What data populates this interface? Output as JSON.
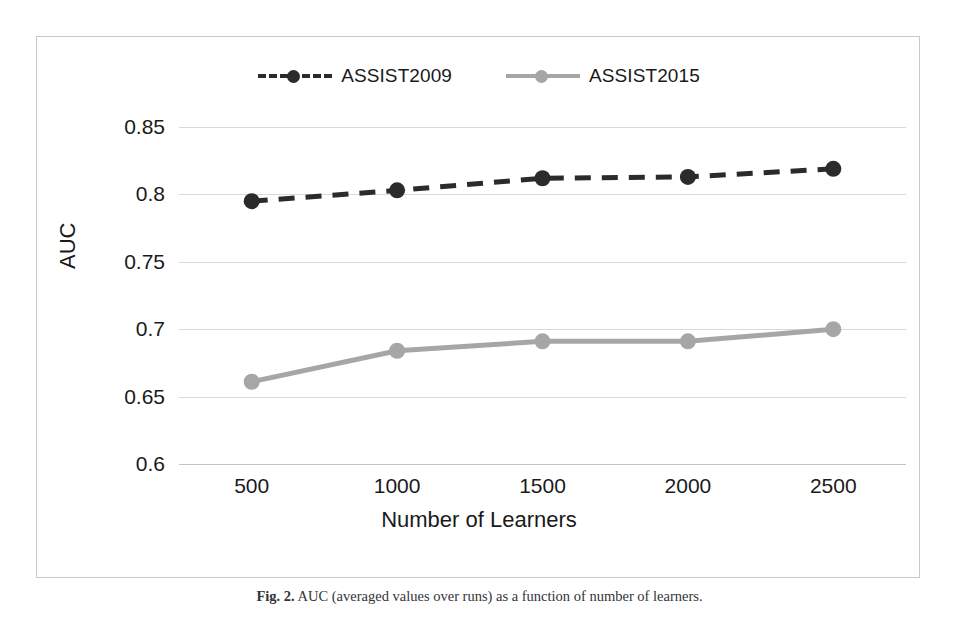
{
  "figure": {
    "caption_label": "Fig. 2.",
    "caption_text": "AUC (averaged values over runs) as a function of number of learners."
  },
  "chart_data": {
    "type": "line",
    "title": "",
    "xlabel": "Number of Learners",
    "ylabel": "AUC",
    "categories": [
      "500",
      "1000",
      "1500",
      "2000",
      "2500"
    ],
    "x": [
      500,
      1000,
      1500,
      2000,
      2500
    ],
    "ylim": [
      0.6,
      0.85
    ],
    "yticks": [
      "0.85",
      "0.8",
      "0.75",
      "0.7",
      "0.65",
      "0.6"
    ],
    "ytick_values": [
      0.85,
      0.8,
      0.75,
      0.7,
      0.65,
      0.6
    ],
    "grid": true,
    "legend_position": "top-center",
    "series": [
      {
        "name": "ASSIST2009",
        "values": [
          0.795,
          0.803,
          0.812,
          0.813,
          0.819
        ],
        "color": "#2b2b2b",
        "linestyle": "dashed",
        "marker": "circle"
      },
      {
        "name": "ASSIST2015",
        "values": [
          0.661,
          0.684,
          0.691,
          0.691,
          0.7
        ],
        "color": "#a6a6a6",
        "linestyle": "solid",
        "marker": "circle"
      }
    ]
  }
}
